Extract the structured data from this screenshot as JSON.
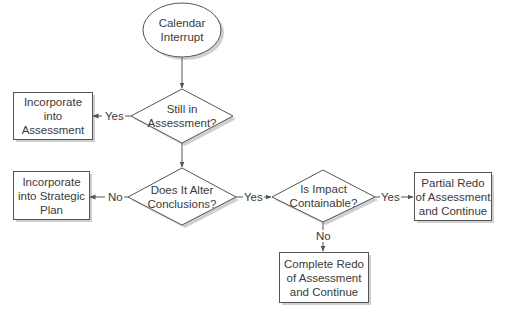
{
  "diagram": {
    "type": "flowchart",
    "colors": {
      "stroke": "#555555",
      "shadow": "#c8c8c8",
      "fill": "#ffffff",
      "text": "#3a3a3a"
    },
    "nodes": {
      "start": {
        "shape": "ellipse",
        "lines": [
          "Calendar",
          "Interrupt"
        ]
      },
      "still_in_assessment": {
        "shape": "diamond",
        "lines": [
          "Still in",
          "Assessment?"
        ]
      },
      "incorporate_assessment": {
        "shape": "rect",
        "lines": [
          "Incorporate",
          "into",
          "Assessment"
        ]
      },
      "alter_conclusions": {
        "shape": "diamond",
        "lines": [
          "Does It Alter",
          "Conclusions?"
        ]
      },
      "incorporate_strategic": {
        "shape": "rect",
        "lines": [
          "Incorporate",
          "into Strategic",
          "Plan"
        ]
      },
      "impact_containable": {
        "shape": "diamond",
        "lines": [
          "Is Impact",
          "Containable?"
        ]
      },
      "partial_redo": {
        "shape": "rect",
        "lines": [
          "Partial Redo",
          "of Assessment",
          "and Continue"
        ]
      },
      "complete_redo": {
        "shape": "rect",
        "lines": [
          "Complete Redo",
          "of Assessment",
          "and Continue"
        ]
      }
    },
    "edges": [
      {
        "from": "start",
        "to": "still_in_assessment",
        "label": ""
      },
      {
        "from": "still_in_assessment",
        "to": "incorporate_assessment",
        "label": "Yes"
      },
      {
        "from": "still_in_assessment",
        "to": "alter_conclusions",
        "label": ""
      },
      {
        "from": "alter_conclusions",
        "to": "incorporate_strategic",
        "label": "No"
      },
      {
        "from": "alter_conclusions",
        "to": "impact_containable",
        "label": "Yes"
      },
      {
        "from": "impact_containable",
        "to": "partial_redo",
        "label": "Yes"
      },
      {
        "from": "impact_containable",
        "to": "complete_redo",
        "label": "No"
      }
    ]
  }
}
